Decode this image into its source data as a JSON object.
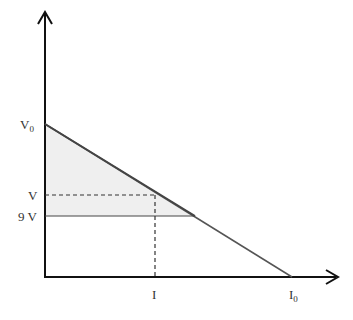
{
  "diagram": {
    "type": "V-I characteristic (linear load line)",
    "y_axis_labels": {
      "v0": "V",
      "v0_sub": "0",
      "v": "V",
      "nine_v": "9 V"
    },
    "x_axis_labels": {
      "i": "I",
      "i0": "I",
      "i0_sub": "0"
    },
    "colors": {
      "axis": "#111111",
      "line": "#444444",
      "fill": "#efefef",
      "dash": "#333333"
    }
  }
}
